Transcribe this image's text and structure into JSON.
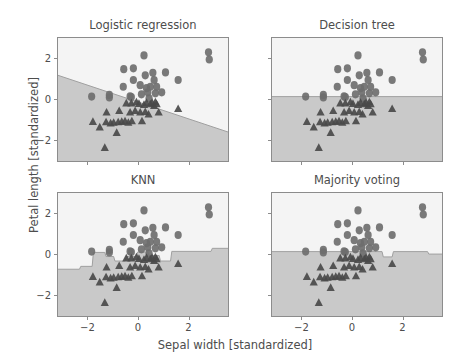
{
  "chart_data": {
    "type": "scatter",
    "title": "",
    "xlabel": "Sepal width [standardized]",
    "ylabel": "Petal length [standardized]",
    "xlim": [
      -3.2,
      3.6
    ],
    "ylim": [
      -3.1,
      3.0
    ],
    "xticks": [
      -2,
      0,
      2
    ],
    "xticklabels": [
      "−2",
      "0",
      "2"
    ],
    "yticks": [
      -2,
      0,
      2
    ],
    "yticklabels": [
      "−2",
      "0",
      "2"
    ],
    "grid": false,
    "legend": "none",
    "colors": {
      "region_upper": "#f4f4f4",
      "region_lower": "#c9c9c9",
      "boundary_line": "#a0a0a0",
      "marker_circle": "#6e6e6e",
      "marker_triangle": "#4a4a4a",
      "axis": "#8c8c8c",
      "text": "#4d4d4d",
      "background": "#ffffff"
    },
    "panels": [
      {
        "id": "logistic-regression",
        "title": "Logistic regression",
        "boundary_type": "linear",
        "boundary_points": [
          [
            -3.2,
            1.18
          ],
          [
            3.6,
            -1.62
          ]
        ]
      },
      {
        "id": "decision-tree",
        "title": "Decision tree",
        "boundary_type": "axis-aligned-threshold",
        "boundary_points": [
          [
            -3.2,
            0.14
          ],
          [
            3.6,
            0.14
          ]
        ]
      },
      {
        "id": "knn",
        "title": "KNN",
        "boundary_type": "nonparametric",
        "boundary_points": [
          [
            -3.2,
            -0.72
          ],
          [
            -2.35,
            -0.72
          ],
          [
            -2.3,
            -0.58
          ],
          [
            -1.85,
            -0.58
          ],
          [
            -1.8,
            0.1
          ],
          [
            -1.35,
            0.1
          ],
          [
            -1.3,
            -0.1
          ],
          [
            -1.0,
            -0.1
          ],
          [
            -0.95,
            -0.32
          ],
          [
            -0.55,
            -0.32
          ],
          [
            -0.5,
            -0.1
          ],
          [
            -0.1,
            -0.1
          ],
          [
            -0.05,
            0.12
          ],
          [
            0.35,
            0.12
          ],
          [
            0.4,
            -0.05
          ],
          [
            0.8,
            -0.05
          ],
          [
            0.85,
            -0.32
          ],
          [
            1.25,
            -0.32
          ],
          [
            1.3,
            0.15
          ],
          [
            2.85,
            0.15
          ],
          [
            2.9,
            0.3
          ],
          [
            3.6,
            0.3
          ]
        ]
      },
      {
        "id": "majority-voting",
        "title": "Majority voting",
        "boundary_type": "ensemble",
        "boundary_points": [
          [
            -3.2,
            0.14
          ],
          [
            1.15,
            0.14
          ],
          [
            1.2,
            -0.12
          ],
          [
            1.55,
            -0.12
          ],
          [
            1.6,
            0.14
          ],
          [
            2.95,
            0.14
          ],
          [
            3.0,
            0.02
          ],
          [
            3.6,
            0.02
          ]
        ]
      }
    ],
    "series": [
      {
        "name": "class-circle",
        "marker": "circle",
        "color": "#6e6e6e",
        "points": [
          [
            -1.87,
            0.14
          ],
          [
            -1.17,
            0.1
          ],
          [
            -1.17,
            0.22
          ],
          [
            -0.62,
            0.62
          ],
          [
            -0.6,
            1.48
          ],
          [
            -0.35,
            0.15
          ],
          [
            -0.3,
            0.12
          ],
          [
            -0.22,
            0.95
          ],
          [
            -0.22,
            1.52
          ],
          [
            0.05,
            0.7
          ],
          [
            0.1,
            0.25
          ],
          [
            0.2,
            2.15
          ],
          [
            0.25,
            1.18
          ],
          [
            0.3,
            0.55
          ],
          [
            0.35,
            0.35
          ],
          [
            0.4,
            0.05
          ],
          [
            0.45,
            0.62
          ],
          [
            0.55,
            1.3
          ],
          [
            0.6,
            0.95
          ],
          [
            0.65,
            0.3
          ],
          [
            0.7,
            0.62
          ],
          [
            0.9,
            0.35
          ],
          [
            1.05,
            1.32
          ],
          [
            1.55,
            0.95
          ],
          [
            2.75,
            2.3
          ],
          [
            2.78,
            1.95
          ]
        ]
      },
      {
        "name": "class-triangle",
        "marker": "triangle",
        "color": "#4a4a4a",
        "points": [
          [
            -1.82,
            -1.08
          ],
          [
            -1.55,
            -1.35
          ],
          [
            -1.35,
            -2.35
          ],
          [
            -1.3,
            -1.1
          ],
          [
            -1.28,
            -0.62
          ],
          [
            -1.12,
            -1.15
          ],
          [
            -1.0,
            -1.12
          ],
          [
            -0.88,
            -1.62
          ],
          [
            -0.82,
            -1.1
          ],
          [
            -0.78,
            -0.55
          ],
          [
            -0.68,
            -1.08
          ],
          [
            -0.55,
            -1.05
          ],
          [
            -0.5,
            -0.18
          ],
          [
            -0.42,
            -1.12
          ],
          [
            -0.35,
            -0.62
          ],
          [
            -0.3,
            -0.18
          ],
          [
            -0.28,
            -1.05
          ],
          [
            -0.15,
            -0.55
          ],
          [
            -0.1,
            -0.12
          ],
          [
            0.0,
            -0.2
          ],
          [
            0.05,
            -0.62
          ],
          [
            0.12,
            -1.05
          ],
          [
            0.2,
            -0.25
          ],
          [
            0.25,
            -0.6
          ],
          [
            0.3,
            -0.15
          ],
          [
            0.38,
            -0.72
          ],
          [
            0.45,
            -0.22
          ],
          [
            0.52,
            -0.15
          ],
          [
            0.6,
            -0.3
          ],
          [
            0.65,
            -0.12
          ],
          [
            0.7,
            -0.22
          ],
          [
            0.78,
            -0.62
          ],
          [
            1.55,
            -0.45
          ]
        ]
      }
    ]
  },
  "axis_label_x": "Sepal width [standardized]",
  "axis_label_y": "Petal length [standardized]"
}
